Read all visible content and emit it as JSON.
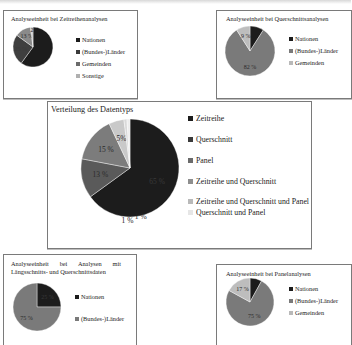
{
  "charts": {
    "zeitreihen": {
      "title": "Analyseeinheit bei Zeitreihenanalysen",
      "legend": [
        "Nationen",
        "(Bundes-)Länder",
        "Gemeinden",
        "Sonstige"
      ],
      "labels": [
        "",
        "25 %",
        "13 %",
        "2"
      ]
    },
    "querschnitt": {
      "title": "Analyseeinheit bei Querschnittsanalysen",
      "legend": [
        "Nationen",
        "(Bundes-)Länder",
        "Gemeinden"
      ],
      "labels": [
        "",
        "82 %",
        "9 %"
      ]
    },
    "datentyp": {
      "title": "Verteilung des Datentyps",
      "legend": [
        "Zeitreihe",
        "Querschnitt",
        "Panel",
        "Zeitreihe und Querschnitt",
        "Zeitreihe und Querschnitt und Panel",
        "Querschnitt und Panel"
      ],
      "labels": [
        "65 %",
        "13 %",
        "15 %",
        "5%",
        "1 %",
        "1 %"
      ]
    },
    "laengsquer": {
      "title": "Analyseeinheit bei Analysen mit Längsschnitts- und Querschnittsdaten",
      "legend": [
        "Nationen",
        "(Bundes-)Länder"
      ],
      "labels": [
        "25 %",
        "75 %"
      ]
    },
    "panel": {
      "title": "Analyseeinheit bei Panelanalysen",
      "legend": [
        "Nationen",
        "(Bundes-)Länder",
        "Gemeinden"
      ],
      "labels": [
        "",
        "75 %",
        "17 %"
      ]
    }
  },
  "colors": {
    "c1": "#1c1c1c",
    "c2": "#3a3a3a",
    "c3": "#6b6b6b",
    "c4": "#8e8e8e",
    "c5": "#b9b9b9",
    "c6": "#dcdcdc"
  },
  "chart_data": [
    {
      "type": "pie",
      "title": "Analyseeinheit bei Zeitreihenanalysen",
      "categories": [
        "Nationen",
        "(Bundes-)Länder",
        "Gemeinden",
        "Sonstige"
      ],
      "values": [
        60,
        25,
        13,
        2
      ],
      "legend_position": "right"
    },
    {
      "type": "pie",
      "title": "Analyseeinheit bei Querschnittsanalysen",
      "categories": [
        "Nationen",
        "(Bundes-)Länder",
        "Gemeinden"
      ],
      "values": [
        9,
        82,
        9
      ],
      "legend_position": "right"
    },
    {
      "type": "pie",
      "title": "Verteilung des Datentyps",
      "categories": [
        "Zeitreihe",
        "Querschnitt",
        "Panel",
        "Zeitreihe und Querschnitt",
        "Zeitreihe und Querschnitt und Panel",
        "Querschnitt und Panel"
      ],
      "values": [
        65,
        13,
        15,
        5,
        1,
        1
      ],
      "legend_position": "right"
    },
    {
      "type": "pie",
      "title": "Analyseeinheit bei Analysen mit Längsschnitts- und Querschnittsdaten",
      "categories": [
        "Nationen",
        "(Bundes-)Länder"
      ],
      "values": [
        25,
        75
      ],
      "legend_position": "right"
    },
    {
      "type": "pie",
      "title": "Analyseeinheit bei Panelanalysen",
      "categories": [
        "Nationen",
        "(Bundes-)Länder",
        "Gemeinden"
      ],
      "values": [
        8,
        75,
        17
      ],
      "legend_position": "right"
    }
  ]
}
